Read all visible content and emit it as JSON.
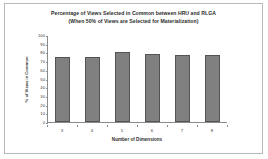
{
  "chart_data": {
    "type": "bar",
    "title": "Percentage of Views Selected in Common between HRU and RLGA",
    "subtitle": "(When 50% of Views are Selected for Materialization)",
    "xlabel": "Number of Dimensions",
    "ylabel": "% of Views in Common",
    "categories": [
      "3",
      "4",
      "5",
      "6",
      "7",
      "8"
    ],
    "values": [
      75,
      75,
      81,
      78,
      77,
      77.5
    ],
    "ylim": [
      0,
      100
    ],
    "yticks": [
      "100",
      "90",
      "80",
      "70",
      "60",
      "50",
      "40",
      "30",
      "20",
      "10",
      "0"
    ],
    "ytick_values": [
      100,
      90,
      80,
      70,
      60,
      50,
      40,
      30,
      20,
      10,
      0
    ],
    "grid": false,
    "legend": "none",
    "bar_color": "#808080",
    "bar_border_color": "#545454",
    "axis_color": "#8a8a8a",
    "frame_color": "#b9b9b9"
  }
}
